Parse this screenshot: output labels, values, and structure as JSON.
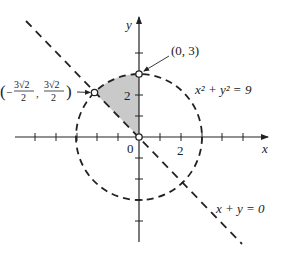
{
  "diagram": {
    "type": "coordinate-plane",
    "axes": {
      "x_label": "x",
      "y_label": "y",
      "origin_label": "0",
      "x_tick_label": "2",
      "y_tick_label": "2",
      "tick_spacing_units": 1,
      "x_range": [
        -6,
        6
      ],
      "y_range": [
        -5,
        5
      ]
    },
    "curves": [
      {
        "id": "circle",
        "equation_label": "x² + y² = 9",
        "style": "dashed",
        "radius": 3
      },
      {
        "id": "line",
        "equation_label": "x + y = 0",
        "style": "dashed"
      }
    ],
    "points": [
      {
        "id": "p1",
        "label": "(0, 3)",
        "x": 0,
        "y": 3,
        "style": "open"
      },
      {
        "id": "p2",
        "label_parts": {
          "lparen": "(",
          "neg": "−",
          "num": "3√2",
          "den": "2",
          "comma": ",",
          "rparen": ")"
        },
        "x": -2.1213,
        "y": 2.1213,
        "style": "open"
      },
      {
        "id": "origin",
        "x": 0,
        "y": 0,
        "style": "open"
      }
    ],
    "shaded_region": {
      "description": "Region bounded by x=0, x+y=0, and the circle x²+y²=9 in the second quadrant",
      "color": "#c9c9c9"
    },
    "colors": {
      "stroke": "#222222",
      "shade": "#c9c9c9",
      "background": "#ffffff"
    }
  }
}
